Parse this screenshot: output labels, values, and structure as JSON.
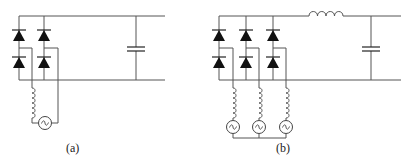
{
  "figure": {
    "panels": [
      {
        "id": "a",
        "label": "(a)",
        "description": "Single-phase full-bridge diode rectifier with AC source, series inductance and DC-link capacitor",
        "components": {
          "diodes": 4,
          "ac_sources": 1,
          "source_inductors": 1,
          "dc_inductors": 0,
          "capacitors": 1
        }
      },
      {
        "id": "b",
        "label": "(b)",
        "description": "Three-phase full-bridge diode rectifier with wye-connected AC sources, line inductances, DC inductor and DC-link capacitor",
        "components": {
          "diodes": 6,
          "ac_sources": 3,
          "source_inductors": 3,
          "dc_inductors": 1,
          "capacitors": 1
        }
      }
    ],
    "colors": {
      "wire": "#555555",
      "diode": "#111111",
      "background": "#ffffff"
    }
  }
}
